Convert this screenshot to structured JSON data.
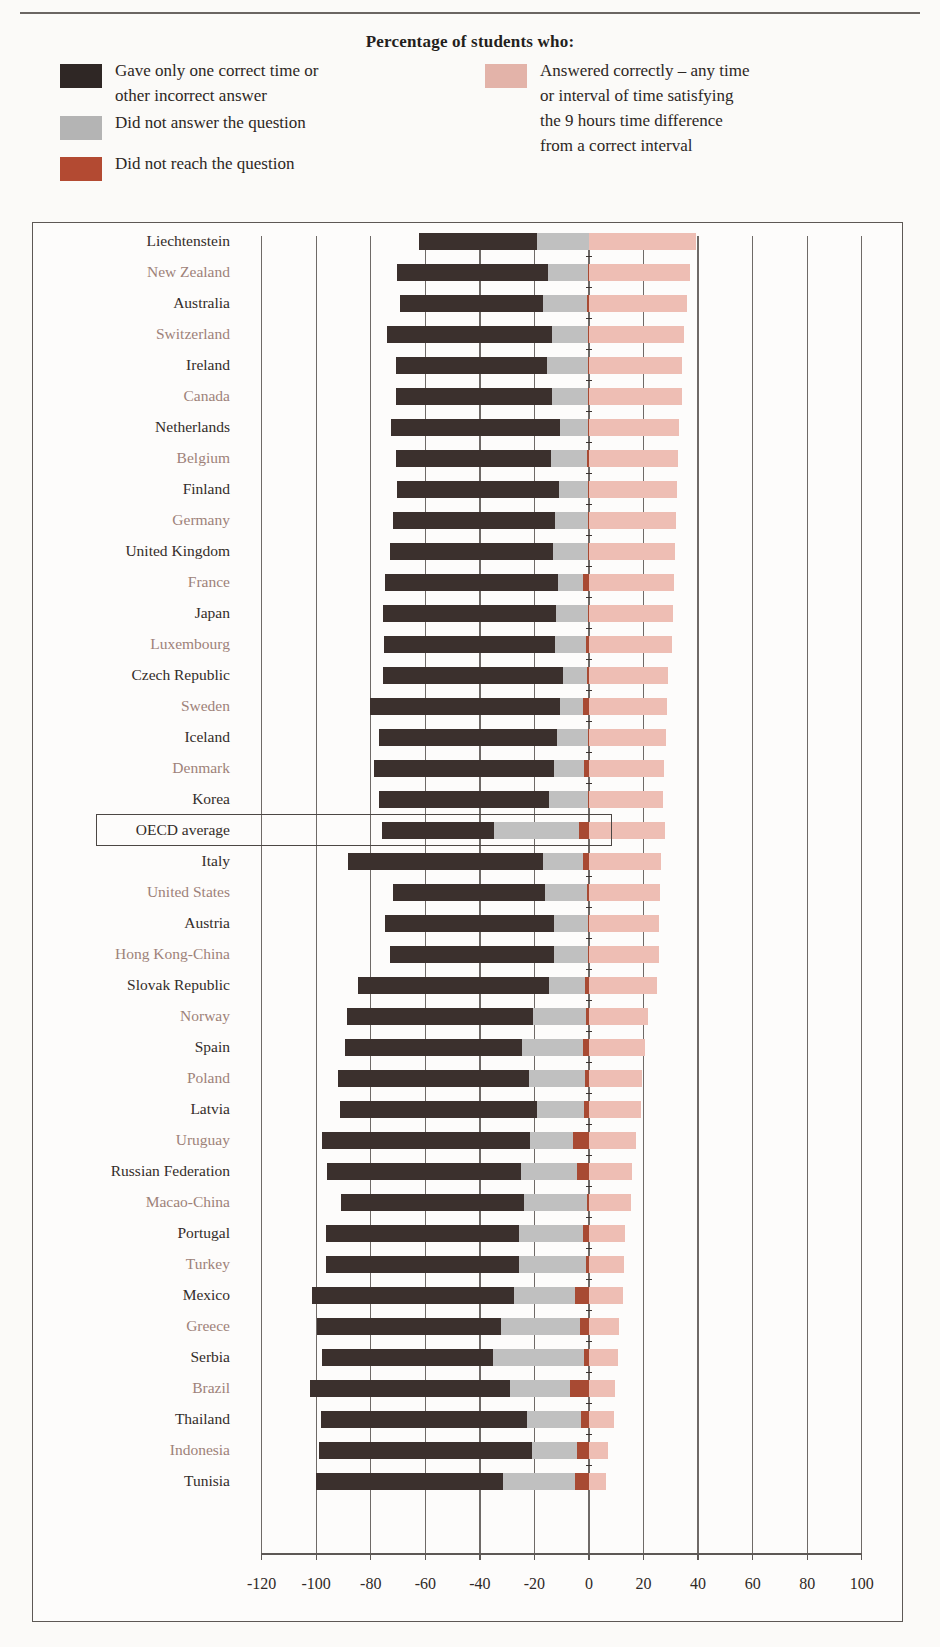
{
  "header": {
    "legend_title": "Percentage of students who:",
    "crumb": ""
  },
  "legend": {
    "items": [
      {
        "name": "incorrect",
        "color": "#2f2725",
        "label": "Gave only one correct time or\nother incorrect answer",
        "col": "left"
      },
      {
        "name": "no-answer",
        "color": "#b4b4b4",
        "label": "Did not answer the question",
        "col": "left"
      },
      {
        "name": "not-reached",
        "color": "#b34a32",
        "label": "Did not reach the question",
        "col": "left"
      },
      {
        "name": "correct",
        "color": "#e3b3a9",
        "label": "Answered correctly – any time\nor interval of time satisfying\nthe 9 hours time difference\nfrom a correct interval",
        "col": "right"
      }
    ]
  },
  "axis": {
    "ticks": [
      -120,
      -100,
      -80,
      -60,
      -40,
      -20,
      0,
      20,
      40,
      60,
      80,
      100
    ],
    "tick_labels": [
      "-120",
      "-100",
      "-80",
      "-60",
      "-40",
      "-20",
      "0",
      "20",
      "40",
      "60",
      "80",
      "100"
    ],
    "min": -130,
    "max": 105
  },
  "highlight": {
    "row": "OECD average"
  },
  "chart_data": {
    "type": "bar",
    "orientation": "horizontal",
    "stacked": true,
    "title": "Percentage of students who:",
    "xlabel": "",
    "ylabel": "",
    "xlim": [
      -130,
      105
    ],
    "grid": true,
    "legend_position": "top",
    "series": [
      {
        "name": "Gave only one correct time or other incorrect answer",
        "color": "#3b302d"
      },
      {
        "name": "Did not answer the question",
        "color": "#c0c0c0"
      },
      {
        "name": "Did not reach the question",
        "color": "#a84a33"
      },
      {
        "name": "Answered correctly – any time or interval of time satisfying the 9 hours time difference from a correct interval",
        "color": "#eebeb4"
      }
    ],
    "categories": [
      "Liechtenstein",
      "New Zealand",
      "Australia",
      "Switzerland",
      "Ireland",
      "Canada",
      "Netherlands",
      "Belgium",
      "Finland",
      "Germany",
      "United Kingdom",
      "France",
      "Japan",
      "Luxembourg",
      "Czech Republic",
      "Sweden",
      "Iceland",
      "Denmark",
      "Korea",
      "OECD average",
      "Italy",
      "United States",
      "Austria",
      "Hong Kong-China",
      "Slovak Republic",
      "Norway",
      "Spain",
      "Poland",
      "Latvia",
      "Uruguay",
      "Russian Federation",
      "Macao-China",
      "Portugal",
      "Turkey",
      "Mexico",
      "Greece",
      "Serbia",
      "Brazil",
      "Thailand",
      "Indonesia",
      "Tunisia"
    ],
    "rows": [
      {
        "country": "Liechtenstein",
        "incorrect": 43.4,
        "no_answer": 18.9,
        "not_reached": 0.0,
        "correct": 39.3
      },
      {
        "country": "New Zealand",
        "incorrect": 55.3,
        "no_answer": 14.5,
        "not_reached": 0.4,
        "correct": 37.1
      },
      {
        "country": "Australia",
        "incorrect": 52.4,
        "no_answer": 16.0,
        "not_reached": 0.7,
        "correct": 36.0
      },
      {
        "country": "Switzerland",
        "incorrect": 60.4,
        "no_answer": 13.1,
        "not_reached": 0.4,
        "correct": 34.9
      },
      {
        "country": "Ireland",
        "incorrect": 55.6,
        "no_answer": 14.9,
        "not_reached": 0.4,
        "correct": 34.2
      },
      {
        "country": "Canada",
        "incorrect": 57.1,
        "no_answer": 13.1,
        "not_reached": 0.4,
        "correct": 34.0
      },
      {
        "country": "Netherlands",
        "incorrect": 61.8,
        "no_answer": 10.2,
        "not_reached": 0.4,
        "correct": 33.1
      },
      {
        "country": "Belgium",
        "incorrect": 57.1,
        "no_answer": 13.1,
        "not_reached": 0.7,
        "correct": 32.7
      },
      {
        "country": "Finland",
        "incorrect": 59.6,
        "no_answer": 10.5,
        "not_reached": 0.4,
        "correct": 32.4
      },
      {
        "country": "Germany",
        "incorrect": 59.3,
        "no_answer": 12.0,
        "not_reached": 0.4,
        "correct": 32.0
      },
      {
        "country": "United Kingdom",
        "incorrect": 60.0,
        "no_answer": 12.7,
        "not_reached": 0.4,
        "correct": 31.6
      },
      {
        "country": "France",
        "incorrect": 63.6,
        "no_answer": 9.1,
        "not_reached": 2.2,
        "correct": 31.3
      },
      {
        "country": "Japan",
        "incorrect": 63.6,
        "no_answer": 11.6,
        "not_reached": 0.4,
        "correct": 30.9
      },
      {
        "country": "Luxembourg",
        "incorrect": 62.9,
        "no_answer": 11.3,
        "not_reached": 1.1,
        "correct": 30.5
      },
      {
        "country": "Czech Republic",
        "incorrect": 66.2,
        "no_answer": 8.7,
        "not_reached": 0.7,
        "correct": 29.1
      },
      {
        "country": "Sweden",
        "incorrect": 69.5,
        "no_answer": 8.4,
        "not_reached": 2.2,
        "correct": 28.7
      },
      {
        "country": "Iceland",
        "incorrect": 65.1,
        "no_answer": 11.3,
        "not_reached": 0.4,
        "correct": 28.4
      },
      {
        "country": "Denmark",
        "incorrect": 66.2,
        "no_answer": 10.9,
        "not_reached": 1.8,
        "correct": 27.6
      },
      {
        "country": "Korea",
        "incorrect": 62.2,
        "no_answer": 14.2,
        "not_reached": 0.4,
        "correct": 27.3
      },
      {
        "country": "OECD average",
        "incorrect": 41.1,
        "no_answer": 31.3,
        "not_reached": 3.6,
        "correct": 28.0
      },
      {
        "country": "Italy",
        "incorrect": 71.6,
        "no_answer": 14.5,
        "not_reached": 2.2,
        "correct": 26.5
      },
      {
        "country": "United States",
        "incorrect": 56.0,
        "no_answer": 15.3,
        "not_reached": 0.7,
        "correct": 26.2
      },
      {
        "country": "Austria",
        "incorrect": 61.8,
        "no_answer": 12.4,
        "not_reached": 0.4,
        "correct": 25.8
      },
      {
        "country": "Hong Kong-China",
        "incorrect": 60.0,
        "no_answer": 12.4,
        "not_reached": 0.4,
        "correct": 25.5
      },
      {
        "country": "Slovak Republic",
        "incorrect": 70.2,
        "no_answer": 13.1,
        "not_reached": 1.5,
        "correct": 25.1
      },
      {
        "country": "Norway",
        "incorrect": 68.0,
        "no_answer": 19.6,
        "not_reached": 1.1,
        "correct": 21.5
      },
      {
        "country": "Spain",
        "incorrect": 64.7,
        "no_answer": 22.5,
        "not_reached": 2.2,
        "correct": 20.7
      },
      {
        "country": "Poland",
        "incorrect": 70.2,
        "no_answer": 20.4,
        "not_reached": 1.5,
        "correct": 19.3
      },
      {
        "country": "Latvia",
        "incorrect": 72.4,
        "no_answer": 17.1,
        "not_reached": 1.8,
        "correct": 18.9
      },
      {
        "country": "Uruguay",
        "incorrect": 76.0,
        "no_answer": 16.0,
        "not_reached": 5.8,
        "correct": 17.1
      },
      {
        "country": "Russian Federation",
        "incorrect": 71.3,
        "no_answer": 20.4,
        "not_reached": 4.4,
        "correct": 15.6
      },
      {
        "country": "Macao-China",
        "incorrect": 66.9,
        "no_answer": 23.3,
        "not_reached": 0.7,
        "correct": 15.3
      },
      {
        "country": "Portugal",
        "incorrect": 70.9,
        "no_answer": 23.3,
        "not_reached": 2.2,
        "correct": 13.1
      },
      {
        "country": "Turkey",
        "incorrect": 70.9,
        "no_answer": 24.4,
        "not_reached": 1.1,
        "correct": 12.7
      },
      {
        "country": "Mexico",
        "incorrect": 73.8,
        "no_answer": 22.5,
        "not_reached": 5.1,
        "correct": 12.4
      },
      {
        "country": "Greece",
        "incorrect": 67.3,
        "no_answer": 29.1,
        "not_reached": 3.3,
        "correct": 10.9
      },
      {
        "country": "Serbia",
        "incorrect": 62.5,
        "no_answer": 33.5,
        "not_reached": 1.8,
        "correct": 10.5
      },
      {
        "country": "Brazil",
        "incorrect": 73.1,
        "no_answer": 22.2,
        "not_reached": 6.9,
        "correct": 9.5
      },
      {
        "country": "Thailand",
        "incorrect": 75.3,
        "no_answer": 20.0,
        "not_reached": 2.9,
        "correct": 9.1
      },
      {
        "country": "Indonesia",
        "incorrect": 78.2,
        "no_answer": 16.4,
        "not_reached": 4.4,
        "correct": 6.9
      },
      {
        "country": "Tunisia",
        "incorrect": 68.4,
        "no_answer": 26.5,
        "not_reached": 5.1,
        "correct": 6.2
      }
    ]
  }
}
